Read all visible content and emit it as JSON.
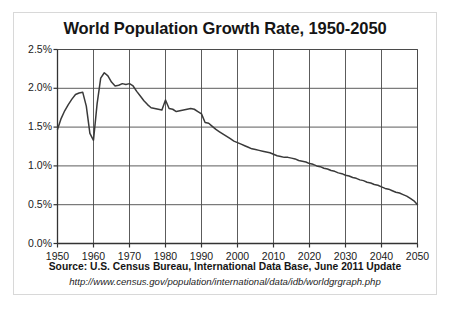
{
  "chart_data": {
    "type": "line",
    "title": "World Population Growth Rate, 1950-2050",
    "xlabel": "",
    "ylabel": "",
    "xlim": [
      1950,
      2050
    ],
    "ylim": [
      0.0,
      2.5
    ],
    "grid": true,
    "legend": "none",
    "series_name": "World population growth rate",
    "line_color": "#3a3a3a",
    "ytick_labels": [
      "0.0%",
      "0.5%",
      "1.0%",
      "1.5%",
      "2.0%",
      "2.5%"
    ],
    "ytick_values": [
      0.0,
      0.5,
      1.0,
      1.5,
      2.0,
      2.5
    ],
    "xtick_labels": [
      "1950",
      "1960",
      "1970",
      "1980",
      "1990",
      "2000",
      "2010",
      "2020",
      "2030",
      "2040",
      "2050"
    ],
    "xtick_values": [
      1950,
      1960,
      1970,
      1980,
      1990,
      2000,
      2010,
      2020,
      2030,
      2040,
      2050
    ],
    "x": [
      1950,
      1951,
      1952,
      1953,
      1954,
      1955,
      1956,
      1957,
      1958,
      1959,
      1960,
      1961,
      1962,
      1963,
      1964,
      1965,
      1966,
      1967,
      1968,
      1969,
      1970,
      1971,
      1972,
      1973,
      1974,
      1975,
      1976,
      1977,
      1978,
      1979,
      1980,
      1981,
      1982,
      1983,
      1984,
      1985,
      1986,
      1987,
      1988,
      1989,
      1990,
      1991,
      1992,
      1993,
      1994,
      1995,
      1996,
      1997,
      1998,
      1999,
      2000,
      2001,
      2002,
      2003,
      2004,
      2005,
      2006,
      2007,
      2008,
      2009,
      2010,
      2011,
      2012,
      2013,
      2014,
      2015,
      2016,
      2017,
      2018,
      2019,
      2020,
      2021,
      2022,
      2023,
      2024,
      2025,
      2026,
      2027,
      2028,
      2029,
      2030,
      2031,
      2032,
      2033,
      2034,
      2035,
      2036,
      2037,
      2038,
      2039,
      2040,
      2041,
      2042,
      2043,
      2044,
      2045,
      2046,
      2047,
      2048,
      2049,
      2050
    ],
    "values": [
      1.47,
      1.61,
      1.71,
      1.79,
      1.86,
      1.92,
      1.94,
      1.95,
      1.77,
      1.42,
      1.33,
      1.8,
      2.13,
      2.2,
      2.16,
      2.08,
      2.03,
      2.04,
      2.06,
      2.05,
      2.06,
      2.03,
      1.96,
      1.9,
      1.84,
      1.79,
      1.75,
      1.74,
      1.73,
      1.72,
      1.85,
      1.74,
      1.73,
      1.7,
      1.71,
      1.72,
      1.73,
      1.74,
      1.73,
      1.7,
      1.67,
      1.56,
      1.55,
      1.51,
      1.47,
      1.44,
      1.41,
      1.38,
      1.35,
      1.32,
      1.3,
      1.28,
      1.26,
      1.24,
      1.22,
      1.21,
      1.2,
      1.19,
      1.18,
      1.17,
      1.15,
      1.13,
      1.12,
      1.11,
      1.11,
      1.1,
      1.09,
      1.07,
      1.06,
      1.05,
      1.03,
      1.02,
      1.0,
      0.99,
      0.97,
      0.96,
      0.94,
      0.93,
      0.91,
      0.9,
      0.88,
      0.87,
      0.85,
      0.84,
      0.82,
      0.81,
      0.79,
      0.78,
      0.76,
      0.75,
      0.73,
      0.71,
      0.7,
      0.68,
      0.66,
      0.65,
      0.63,
      0.61,
      0.58,
      0.55,
      0.5
    ],
    "annotations": {
      "peak_label": "Peak growth ~2.2% in 1963",
      "dip_label": "Trough ~1.33% in 1960",
      "end_label": "Projected 0.5% by 2050"
    }
  },
  "caption": {
    "source_line": "Source: U.S. Census Bureau, International Data Base, June 2011 Update",
    "url_line": "http://www.census.gov/population/international/data/idb/worldgrgraph.php"
  }
}
